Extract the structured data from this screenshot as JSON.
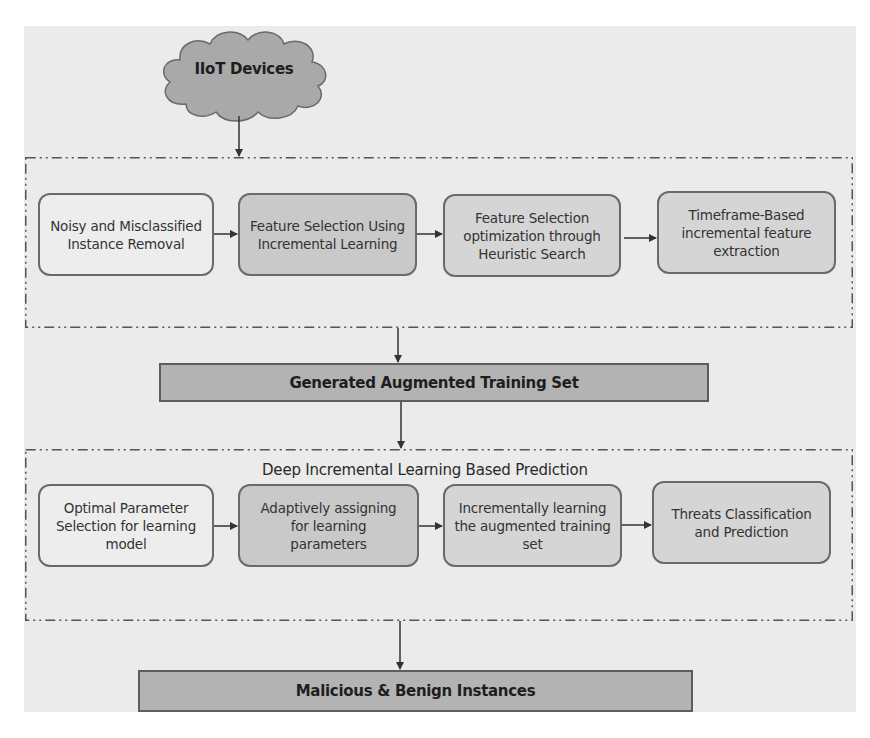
{
  "source": {
    "label": "IIoT Devices",
    "icon": "cloud-icon"
  },
  "stage1": {
    "steps": [
      {
        "label": "Noisy and Misclassified Instance Removal",
        "lines": [
          "Noisy and Misclassified",
          "Instance Removal"
        ]
      },
      {
        "label": "Feature Selection Using Incremental Learning",
        "lines": [
          "Feature Selection Using",
          "Incremental Learning"
        ]
      },
      {
        "label": "Feature Selection optimization through Heuristic Search",
        "lines": [
          "Feature Selection",
          "optimization through",
          "Heuristic Search"
        ]
      },
      {
        "label": "Timeframe-Based incremental feature extraction",
        "lines": [
          "Timeframe-Based",
          "incremental feature",
          "extraction"
        ]
      }
    ]
  },
  "intermediate_output": {
    "label": "Generated Augmented Training Set"
  },
  "stage2": {
    "title": "Deep Incremental Learning Based Prediction",
    "steps": [
      {
        "label": "Optimal Parameter Selection for learning model",
        "lines": [
          "Optimal Parameter",
          "Selection for learning",
          "model"
        ]
      },
      {
        "label": "Adaptively assigning for learning parameters",
        "lines": [
          "Adaptively assigning",
          "for learning",
          "parameters"
        ]
      },
      {
        "label": "Incrementally learning the augmented training set",
        "lines": [
          "Incrementally learning",
          "the augmented training",
          "set"
        ]
      },
      {
        "label": "Threats Classification and Prediction",
        "lines": [
          "Threats Classification",
          "and Prediction"
        ]
      }
    ]
  },
  "final_output": {
    "label": "Malicious & Benign Instances"
  },
  "colors": {
    "panel_background": "#ebebeb",
    "light_node": "#ededed",
    "dark_node": "#c9c9c9",
    "mid_node": "#d5d5d5",
    "bar_fill": "#b3b3b3",
    "cloud_fill": "#a9a9a9",
    "stroke": "#5e5e5e"
  }
}
